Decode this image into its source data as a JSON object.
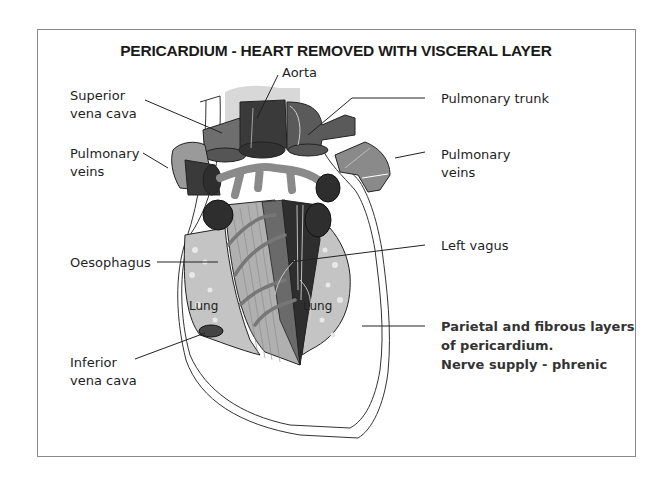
{
  "title": "PERICARDIUM - HEART REMOVED WITH VISCERAL LAYER",
  "labels": {
    "aorta": "Aorta",
    "superior_vena_cava": [
      "Superior",
      "vena cava"
    ],
    "pulmonary_trunk": "Pulmonary trunk",
    "pulmonary_veins_left": [
      "Pulmonary",
      "veins"
    ],
    "pulmonary_veins_right": [
      "Pulmonary",
      "veins"
    ],
    "oesophagus": "Oesophagus",
    "left_vagus": "Left vagus",
    "inferior_vena_cava": [
      "Inferior",
      "vena cava"
    ],
    "pericardium": [
      "Parietal and fibrous layers",
      "of pericardium.",
      "Nerve supply - phrenic"
    ],
    "lung_left": "Lung",
    "lung_right": "Lung"
  },
  "colors": {
    "frame": "#8a8a8a",
    "dark_vessel": "#3a3a3a",
    "mid_vessel": "#6e6e6e",
    "light_vessel": "#9a9a9a",
    "lung": "#c4c4c4",
    "faint": "#d8d8d8"
  }
}
